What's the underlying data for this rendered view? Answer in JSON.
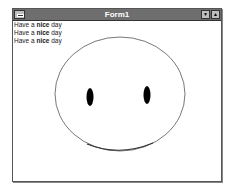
{
  "window": {
    "title": "Form1",
    "system_menu_icon": "system-menu-icon",
    "minimize_icon": "minimize-icon",
    "maximize_icon": "maximize-icon"
  },
  "client": {
    "lines": [
      {
        "prefix": "Have a ",
        "bold": "nice",
        "suffix": " day"
      },
      {
        "prefix": "Have a ",
        "bold": "nice",
        "suffix": " day"
      },
      {
        "prefix": "Have a ",
        "bold": "nice",
        "suffix": " day"
      }
    ],
    "drawing": {
      "subject": "smiley-face",
      "face_outline_color": "#555555",
      "eye_color": "#000000",
      "mouth_color": "#333333"
    }
  }
}
